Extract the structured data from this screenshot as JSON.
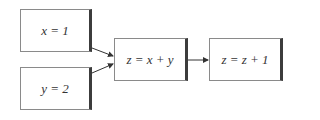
{
  "nodes": [
    {
      "id": "x",
      "label": "x = 1"
    },
    {
      "id": "y",
      "label": "y = 2"
    },
    {
      "id": "sum",
      "label": "z = x + y"
    },
    {
      "id": "inc",
      "label": "z = z + 1"
    }
  ],
  "edges": [
    {
      "from": "x",
      "to": "sum"
    },
    {
      "from": "y",
      "to": "sum"
    },
    {
      "from": "sum",
      "to": "inc"
    }
  ],
  "colors": {
    "border": "#8a8a8a",
    "shadow": "#3c3c3c",
    "arrow": "#333333"
  }
}
